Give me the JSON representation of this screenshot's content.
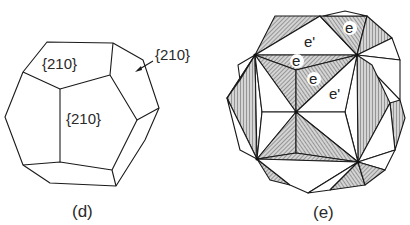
{
  "figure_d": {
    "caption": "(d)",
    "labels": {
      "top_face": "{210}",
      "front_face": "{210}",
      "side_face_callout": "{210}"
    }
  },
  "figure_e": {
    "caption": "(e)",
    "labels": {
      "e_top_right": "e",
      "e_prime_top": "e'",
      "e_upper_mid": "e",
      "e_center": "e",
      "e_prime_right": "e'"
    }
  },
  "colors": {
    "line": "#1a1a1a",
    "hatch_fill": "#a8a8a8",
    "background": "#ffffff"
  }
}
